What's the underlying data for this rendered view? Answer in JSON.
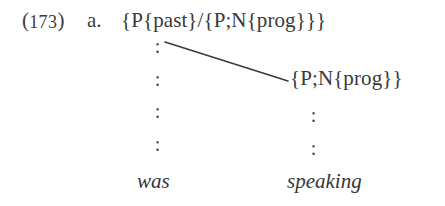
{
  "example": {
    "number_open": "(",
    "number": "173",
    "number_close": ")",
    "sub_label": "a."
  },
  "tree": {
    "root_node": "{P{past}/{P;N{prog}}}",
    "right_node": "{P;N{prog}}",
    "ellipsis_glyph": ":",
    "left_ellipsis_count": 4,
    "right_ellipsis_count": 2,
    "branch": {
      "x1": 165,
      "y1": 42,
      "x2": 288,
      "y2": 81,
      "color": "#3a3a3d",
      "width": 1.6
    },
    "terminals": {
      "left": "was",
      "right": "speaking"
    }
  },
  "colors": {
    "background": "#ffffff",
    "ink": "#37373a"
  }
}
